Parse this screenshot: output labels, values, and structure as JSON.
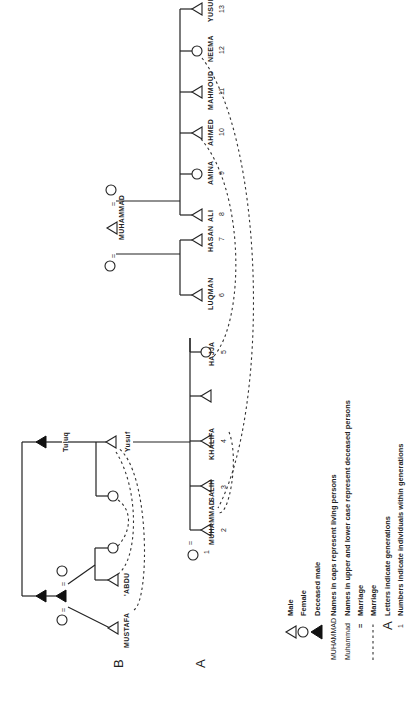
{
  "diagram": {
    "orientation": "rotated 90 degrees counter-clockwise",
    "generations": [
      {
        "label": "B"
      },
      {
        "label": "A"
      }
    ],
    "people_B": [
      {
        "name": "MUSTAFA",
        "sex": "male"
      },
      {
        "name": "'ABDU",
        "sex": "male"
      },
      {
        "name": "Tuluq",
        "sex": "male",
        "deceased": true
      },
      {
        "name": "Yusuf",
        "sex": "male"
      }
    ],
    "people_A": [
      {
        "name": "MUHAMMAD",
        "num": "2",
        "sex": "male"
      },
      {
        "name": "SALIH",
        "num": "3",
        "sex": "male"
      },
      {
        "name": "KHALIFA",
        "num": "4",
        "sex": "male"
      },
      {
        "name": "HAJJA",
        "num": "5",
        "sex": "female"
      },
      {
        "name": "LUQMAN",
        "num": "6",
        "sex": "male"
      },
      {
        "name": "HASAN",
        "num": "7",
        "sex": "male"
      },
      {
        "name": "ALI",
        "num": "8",
        "sex": "male"
      },
      {
        "name": "AMINA",
        "num": "9",
        "sex": "female"
      },
      {
        "name": "AHMED",
        "num": "10",
        "sex": "male"
      },
      {
        "name": "MAHMOUD",
        "num": "11",
        "sex": "male"
      },
      {
        "name": "NEEMA",
        "num": "12",
        "sex": "female"
      },
      {
        "name": "YUSUF",
        "num": "13",
        "sex": "male"
      }
    ],
    "wife_num": "1",
    "parent_male": "MUHAMMAD"
  },
  "legend": {
    "male": "Male",
    "female": "Female",
    "deceased": "Deceased male",
    "caps_example": "MUHAMMAD",
    "caps_text": "Names in caps represent living persons",
    "lower_example": "Muhammad",
    "lower_text": "Names in upper and lower case represent deceased persons",
    "marriage_eq_symbol": "=",
    "marriage_eq_text": "Marriage",
    "marriage_dash_symbol": "- - - - - -",
    "marriage_dash_text": "Marriage",
    "letters_symbol": "A",
    "letters_text": "Letters indicate generations",
    "numbers_symbol": "1",
    "numbers_text": "Numbers indicate individuals within generations"
  }
}
